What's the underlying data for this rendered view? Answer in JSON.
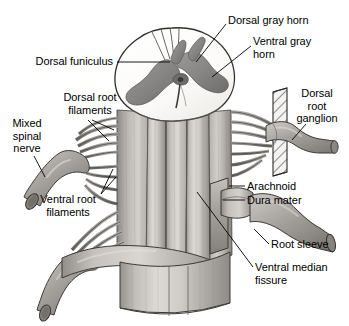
{
  "figure": {
    "type": "anatomical-illustration",
    "background_color": "#ffffff",
    "line_color": "#000000",
    "palette": {
      "white_matter": "#fdfdfb",
      "gray_matter": "#8e8d8b",
      "gray_matter_dark": "#6f6e6c",
      "cord_body_light": "#d8d6d2",
      "cord_body_mid": "#b5b2ad",
      "cord_body_dark": "#8d8a85",
      "rootlet": "#9b9893",
      "dura": "#a4a19c",
      "hatch_fill": "#f2f2f0",
      "outline": "#2b2b2b"
    },
    "labels": [
      {
        "id": "dorsal-funiculus",
        "text": "Dorsal funiculus",
        "align": "right",
        "x": 113,
        "y": 56,
        "leader": [
          [
            116,
            63
          ],
          [
            170,
            63
          ]
        ]
      },
      {
        "id": "dorsal-gray-horn",
        "text": "Dorsal gray horn",
        "align": "left",
        "x": 228,
        "y": 15,
        "leader": [
          [
            226,
            22
          ],
          [
            196,
            62
          ]
        ]
      },
      {
        "id": "ventral-gray-horn",
        "text": "Ventral gray\nhorn",
        "align": "left",
        "x": 253,
        "y": 36,
        "leader": [
          [
            251,
            44
          ],
          [
            211,
            76
          ]
        ]
      },
      {
        "id": "dorsal-root-filaments",
        "text": "Dorsal root\nfilaments",
        "align": "center",
        "x": 90,
        "y": 92,
        "leader_multi": [
          [
            [
              88,
              120
            ],
            [
              107,
              139
            ]
          ],
          [
            [
              92,
              120
            ],
            [
              113,
              129
            ]
          ]
        ]
      },
      {
        "id": "mixed-spinal-nerve",
        "text": "Mixed\nspinal\nnerve",
        "align": "center",
        "x": 25,
        "y": 118,
        "leader": [
          [
            34,
            156
          ],
          [
            44,
            176
          ]
        ]
      },
      {
        "id": "ventral-root-filaments",
        "text": "Ventral root\nfilaments",
        "align": "center",
        "x": 68,
        "y": 194,
        "leader_multi": [
          [
            [
              99,
              196
            ],
            [
              110,
              168
            ]
          ],
          [
            [
              99,
              196
            ],
            [
              113,
              176
            ]
          ]
        ]
      },
      {
        "id": "dorsal-root-ganglion",
        "text": "Dorsal\nroot\nganglion",
        "align": "center",
        "x": 317,
        "y": 88,
        "leader": [
          [
            306,
            125
          ],
          [
            293,
            140
          ]
        ]
      },
      {
        "id": "arachnoid",
        "text": "Arachnoid",
        "align": "left",
        "x": 247,
        "y": 180,
        "leader": [
          [
            245,
            186
          ],
          [
            230,
            186
          ]
        ]
      },
      {
        "id": "dura-mater",
        "text": "Dura mater",
        "align": "left",
        "x": 247,
        "y": 194,
        "leader": [
          [
            245,
            200
          ],
          [
            224,
            200
          ]
        ]
      },
      {
        "id": "root-sleeve",
        "text": "Root sleeve",
        "align": "left",
        "x": 271,
        "y": 239,
        "leader": [
          [
            269,
            245
          ],
          [
            255,
            230
          ]
        ]
      },
      {
        "id": "ventral-median-fissure",
        "text": "Ventral median\nfissure",
        "align": "left",
        "x": 255,
        "y": 262,
        "leader": [
          [
            253,
            268
          ],
          [
            196,
            192
          ]
        ]
      }
    ],
    "structures": [
      "spinal cord white matter cross-section",
      "butterfly-shaped gray matter",
      "central canal",
      "dorsal root filaments",
      "ventral root filaments",
      "dorsal root ganglion",
      "mixed spinal nerve",
      "dura mater sleeve",
      "arachnoid layer",
      "ventral median fissure",
      "root sleeve"
    ]
  }
}
